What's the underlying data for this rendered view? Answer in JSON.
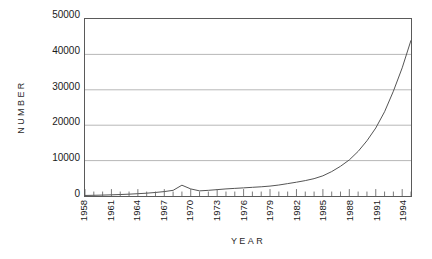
{
  "chart_data": {
    "type": "line",
    "title": "",
    "xlabel": "Year",
    "ylabel": "Number",
    "xlim": [
      1958,
      1995
    ],
    "ylim": [
      0,
      50000
    ],
    "grid": true,
    "legend": null,
    "ytick_labels": [
      "50000",
      "40000",
      "30000",
      "20000",
      "10000",
      "0"
    ],
    "ytick_values": [
      50000,
      40000,
      30000,
      20000,
      10000,
      0
    ],
    "xtick_labels": [
      "1958",
      "1961",
      "1964",
      "1967",
      "1970",
      "1973",
      "1976",
      "1979",
      "1982",
      "1985",
      "1988",
      "1991",
      "1994"
    ],
    "xtick_values": [
      1958,
      1961,
      1964,
      1967,
      1970,
      1973,
      1976,
      1979,
      1982,
      1985,
      1988,
      1991,
      1994
    ],
    "minor_tick_interval": 1,
    "x": [
      1958,
      1959,
      1960,
      1961,
      1962,
      1963,
      1964,
      1965,
      1966,
      1967,
      1968,
      1969,
      1970,
      1971,
      1972,
      1973,
      1974,
      1975,
      1976,
      1977,
      1978,
      1979,
      1980,
      1981,
      1982,
      1983,
      1984,
      1985,
      1986,
      1987,
      1988,
      1989,
      1990,
      1991,
      1992,
      1993,
      1994,
      1995
    ],
    "values": [
      150,
      200,
      260,
      330,
      420,
      520,
      650,
      800,
      1000,
      1250,
      1600,
      3050,
      2000,
      1450,
      1600,
      1800,
      2000,
      2150,
      2300,
      2450,
      2600,
      2800,
      3100,
      3500,
      3900,
      4350,
      4900,
      5700,
      6900,
      8400,
      10200,
      12600,
      15600,
      19200,
      23800,
      29600,
      36200,
      44000
    ],
    "series_color": "#555555",
    "grid_color": "#9a9a9a",
    "axis_color": "#5a5a5a"
  }
}
